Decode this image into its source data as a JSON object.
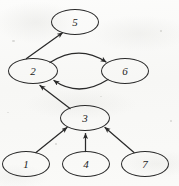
{
  "figure": {
    "background_color": "#fbfbfa",
    "stroke_color": "#2a2a2a",
    "label_color": "#1c1c1c"
  },
  "graph_data": {
    "type": "directed-graph",
    "node_shape": "ellipse",
    "nodes": [
      {
        "id": "5",
        "label": "5",
        "cx": 75,
        "cy": 22,
        "rx": 24,
        "ry": 13
      },
      {
        "id": "2",
        "label": "2",
        "cx": 33,
        "cy": 71,
        "rx": 25,
        "ry": 13
      },
      {
        "id": "6",
        "label": "6",
        "cx": 125,
        "cy": 71,
        "rx": 24,
        "ry": 13
      },
      {
        "id": "3",
        "label": "3",
        "cx": 85,
        "cy": 118,
        "rx": 25,
        "ry": 13
      },
      {
        "id": "1",
        "label": "1",
        "cx": 26,
        "cy": 164,
        "rx": 24,
        "ry": 13
      },
      {
        "id": "4",
        "label": "4",
        "cx": 86,
        "cy": 164,
        "rx": 24,
        "ry": 13
      },
      {
        "id": "7",
        "label": "7",
        "cx": 145,
        "cy": 164,
        "rx": 24,
        "ry": 13
      }
    ],
    "edges": [
      {
        "from": "2",
        "to": "5",
        "style": "straight",
        "arrow": "to-5"
      },
      {
        "from": "2",
        "to": "6",
        "style": "curved-upper",
        "arrow": "to-6"
      },
      {
        "from": "6",
        "to": "2",
        "style": "curved-lower",
        "arrow": "to-2"
      },
      {
        "from": "3",
        "to": "2",
        "style": "straight",
        "arrow": "to-2"
      },
      {
        "from": "1",
        "to": "3",
        "style": "straight",
        "arrow": "to-3"
      },
      {
        "from": "4",
        "to": "3",
        "style": "straight-vertical",
        "arrow": "to-3"
      },
      {
        "from": "7",
        "to": "3",
        "style": "straight",
        "arrow": "to-3"
      }
    ],
    "edge_count": 7,
    "node_count": 7
  }
}
